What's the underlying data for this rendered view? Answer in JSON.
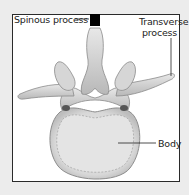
{
  "diagram": {
    "labels": {
      "spinous_process": "Spinous process",
      "transverse_process_line1": "Transverse",
      "transverse_process_line2": "process",
      "body": "Body"
    },
    "colors": {
      "frame_border": "#2a2a2a",
      "background": "#ececec",
      "panel": "#ffffff",
      "bone": "#dcdcdc",
      "bone_shadow": "#9a9a9a",
      "marker": "#000000"
    }
  }
}
